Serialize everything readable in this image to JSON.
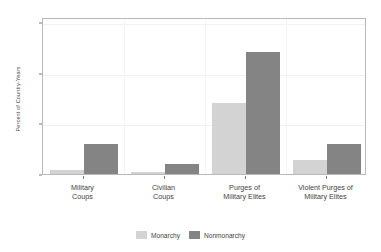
{
  "chart_data": {
    "type": "bar",
    "title": "",
    "subtitle": "",
    "xlabel": "",
    "ylabel": "Percent of Country-Years",
    "categories": [
      "Military\nCoups",
      "Civilian\nCoups",
      "Purges of\nMilitary Elites",
      "Violent Purges of\nMilitary Elites"
    ],
    "category_lines": [
      [
        "Military",
        "Coups"
      ],
      [
        "Civilian",
        "Coups"
      ],
      [
        "Purges of",
        "Military Elites"
      ],
      [
        "Violent Purges of",
        "Military Elites"
      ]
    ],
    "series": [
      {
        "name": "Monarchy",
        "color": "#d3d3d3",
        "values": [
          0.7,
          0.3,
          14.0,
          2.7
        ]
      },
      {
        "name": "Nonmonarchy",
        "color": "#848484",
        "values": [
          6.0,
          2.0,
          24.0,
          6.0
        ]
      }
    ],
    "ylim": [
      0,
      31
    ],
    "yticks": [
      0,
      10,
      20,
      30
    ],
    "ytick_labels": [
      "0",
      "10",
      "20",
      "30"
    ],
    "grid": true,
    "grid_axis": "y",
    "legend_position": "bottom-center",
    "bar_gap_group": 0,
    "background": "#ffffff",
    "frame_color": "#b9b9b9"
  },
  "legend": {
    "items": [
      {
        "label": "Monarchy",
        "color": "#d3d3d3"
      },
      {
        "label": "Nonmonarchy",
        "color": "#848484"
      }
    ]
  }
}
